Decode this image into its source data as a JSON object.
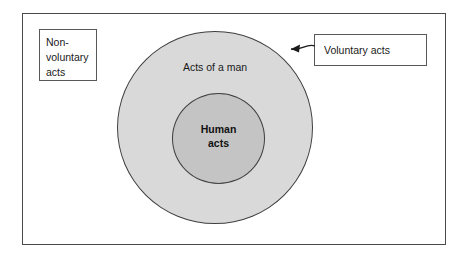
{
  "diagram": {
    "frame": {
      "border_color": "#4a4a4a"
    },
    "circles": {
      "outer": {
        "label": "Acts of a man",
        "fill": "#d9d9d9",
        "stroke": "#3f3f3f"
      },
      "inner": {
        "label_line1": "Human",
        "label_line2": "acts",
        "fill": "#c4c4c4",
        "stroke": "#3f3f3f"
      }
    },
    "callouts": {
      "non_voluntary": {
        "line1": "Non-",
        "line2": "voluntary",
        "line3": "acts"
      },
      "voluntary": {
        "label": "Voluntary acts"
      }
    },
    "arrow": {
      "name": "curved-arrow-to-outer-circle",
      "color": "#1a1a1a"
    }
  }
}
